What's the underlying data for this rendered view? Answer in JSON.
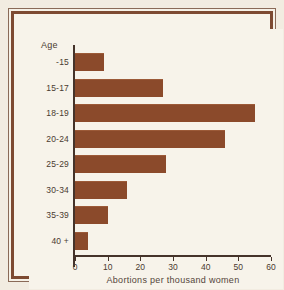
{
  "chart_data": {
    "type": "bar",
    "orientation": "horizontal",
    "title": "",
    "xlabel": "Abortions per thousand women",
    "ylabel": "Age",
    "categories": [
      "-15",
      "15-17",
      "18-19",
      "20-24",
      "25-29",
      "30-34",
      "35-39",
      "40 +"
    ],
    "values": [
      9,
      27,
      55,
      46,
      28,
      16,
      10,
      4
    ],
    "xlim": [
      0,
      60
    ],
    "xticks": [
      "0",
      "10",
      "20",
      "30",
      "40",
      "50",
      "60"
    ],
    "grid": false,
    "legend": null,
    "bar_color": "#8b4a2b",
    "background_color": "#f7f3ea",
    "frame_color": "#7d4a32",
    "axis_color": "#45332a",
    "text_color": "#4a3a30"
  },
  "axis": {
    "y_heading": "Age"
  }
}
